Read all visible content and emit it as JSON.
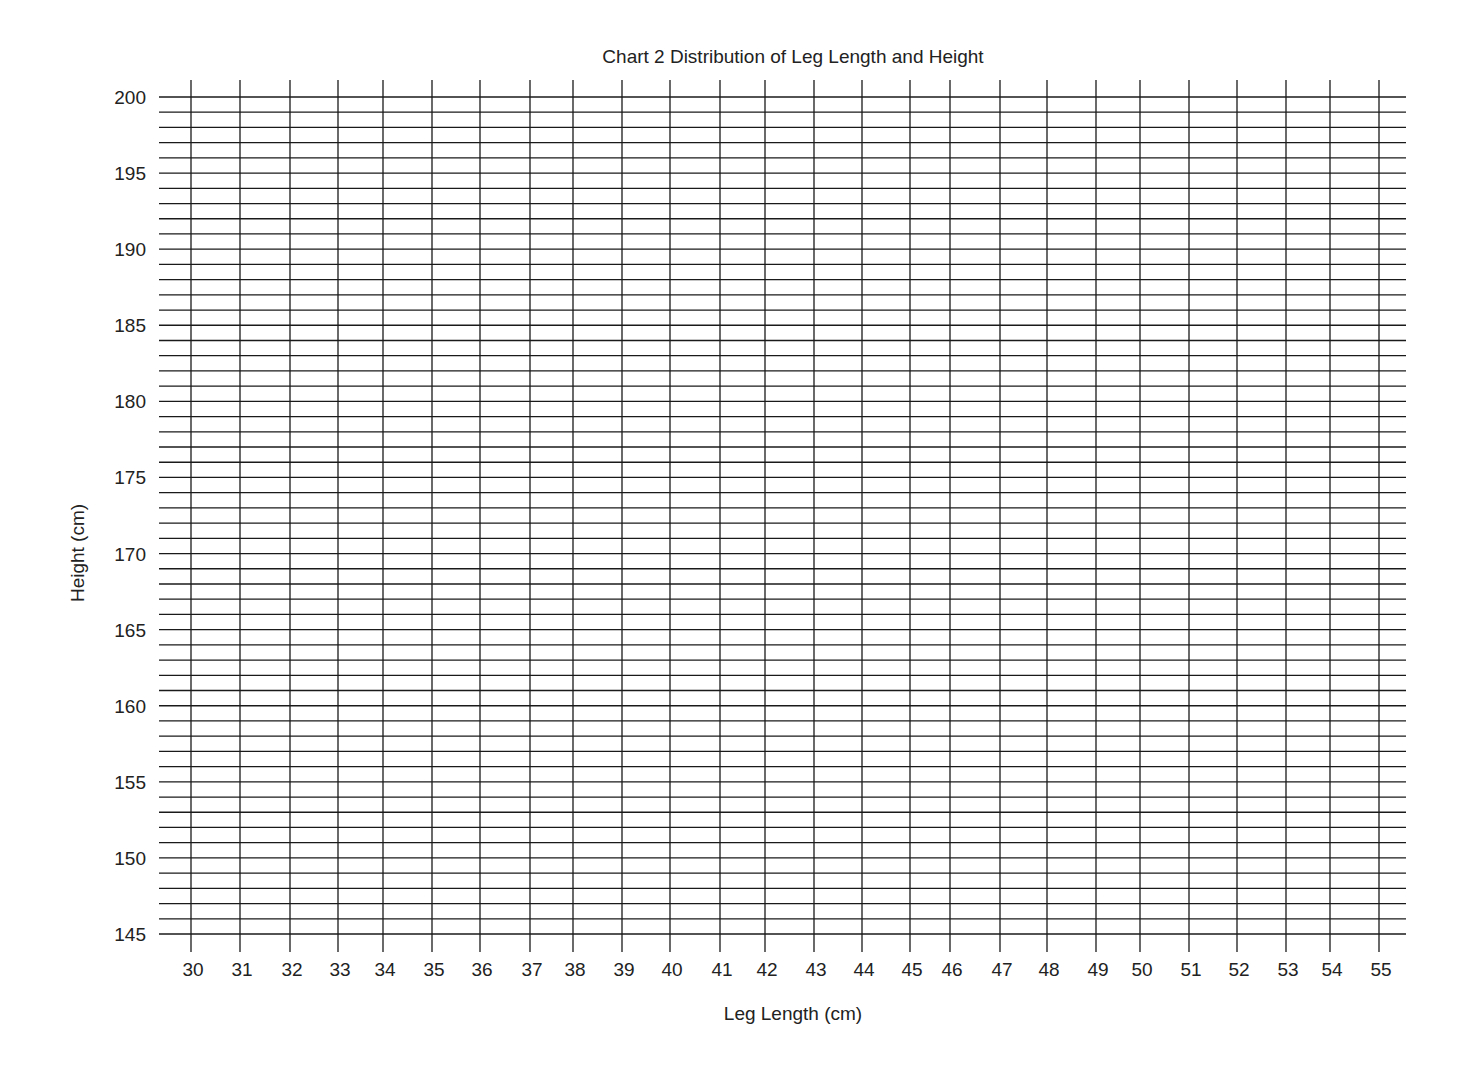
{
  "chart_data": {
    "type": "scatter",
    "title": "Chart 2 Distribution of Leg Length and Height",
    "xlabel": "Leg Length (cm)",
    "ylabel": "Height (cm)",
    "xlim": [
      30,
      55
    ],
    "ylim": [
      145,
      200
    ],
    "x_ticks": [
      30,
      31,
      32,
      33,
      34,
      35,
      36,
      37,
      38,
      39,
      40,
      41,
      42,
      43,
      44,
      45,
      46,
      47,
      48,
      49,
      50,
      51,
      52,
      53,
      54,
      55
    ],
    "y_ticks": [
      145,
      150,
      155,
      160,
      165,
      170,
      175,
      180,
      185,
      190,
      195,
      200
    ],
    "y_minor_step": 1,
    "grid": true,
    "points": [],
    "note": "Blank graph grid; no data points plotted"
  },
  "layout": {
    "x_positions": [
      191,
      240,
      290,
      338,
      383,
      432,
      480,
      530,
      573,
      622,
      670,
      720,
      765,
      814,
      862,
      910,
      950,
      1000,
      1047,
      1096,
      1140,
      1189,
      1237,
      1286,
      1330,
      1379
    ],
    "y_top": 97,
    "y_bottom": 934,
    "h_line_left": 159,
    "h_line_right": 1406,
    "v_line_top": 80,
    "v_line_bottom": 952,
    "line_color": "#1a1a1a"
  }
}
